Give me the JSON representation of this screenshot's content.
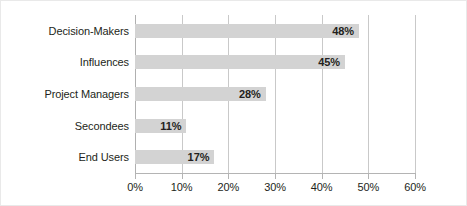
{
  "chart_data": {
    "type": "bar",
    "orientation": "horizontal",
    "title": "",
    "subtitle": "",
    "xlabel": "",
    "ylabel": "",
    "categories": [
      "Decision-Makers",
      "Influences",
      "Project Managers",
      "Secondees",
      "End Users"
    ],
    "values": [
      48,
      45,
      28,
      11,
      17
    ],
    "value_labels": [
      "48%",
      "45%",
      "28%",
      "11%",
      "17%"
    ],
    "xlim": [
      0,
      60
    ],
    "xticks": [
      0,
      10,
      20,
      30,
      40,
      50,
      60
    ],
    "xtick_labels": [
      "0%",
      "10%",
      "20%",
      "30%",
      "40%",
      "50%",
      "60%"
    ],
    "grid": "vertical",
    "legend": "none",
    "series": [
      {
        "name": "",
        "values": [
          48,
          45,
          28,
          11,
          17
        ]
      }
    ],
    "colors": {
      "bar_fill": "#d3d3d3",
      "gridline": "#c9c9c9",
      "axis": "#b4b4b4",
      "text": "#231f20",
      "background": "#ffffff",
      "frame": "#e9e9e9"
    }
  }
}
